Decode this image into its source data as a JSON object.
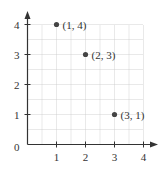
{
  "chart_data": {
    "type": "scatter",
    "title": "",
    "xlabel": "",
    "ylabel": "",
    "xlim": [
      0,
      4
    ],
    "ylim": [
      0,
      4
    ],
    "grid": true,
    "grid_step": 0.5,
    "x_ticks": [
      "1",
      "2",
      "3",
      "4"
    ],
    "y_ticks": [
      "1",
      "2",
      "3",
      "4"
    ],
    "origin_label": "0",
    "points": [
      {
        "x": 1,
        "y": 4,
        "label": "(1, 4)"
      },
      {
        "x": 2,
        "y": 3,
        "label": "(2, 3)"
      },
      {
        "x": 3,
        "y": 1,
        "label": "(3, 1)"
      }
    ]
  },
  "colors": {
    "axis": "#333333",
    "grid": "#c8c8c8",
    "point": "#444444"
  }
}
